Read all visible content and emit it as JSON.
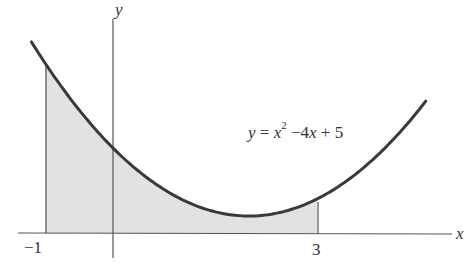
{
  "chart_data": {
    "type": "area",
    "title": "",
    "function": "y = x^2 - 4x + 5",
    "xlabel": "x",
    "ylabel": "y",
    "x_ticks": [
      "-1",
      "3"
    ],
    "shaded_interval": [
      -1,
      3
    ],
    "curve_domain": [
      -1.2,
      4.6
    ],
    "grid": false,
    "points": [
      {
        "x": -1,
        "y": 10
      },
      {
        "x": 0,
        "y": 5
      },
      {
        "x": 1,
        "y": 2
      },
      {
        "x": 2,
        "y": 1
      },
      {
        "x": 3,
        "y": 2
      },
      {
        "x": 4,
        "y": 5
      }
    ],
    "annotation": "y = x² −4x + 5"
  },
  "labels": {
    "x_axis": "x",
    "y_axis": "y",
    "tick_left": "−1",
    "tick_right": "3",
    "eq_y": "y",
    "eq_eq": " = ",
    "eq_x": "x",
    "eq_exp": "2",
    "eq_rest_a": " −4",
    "eq_rest_x": "x",
    "eq_rest_b": " + 5"
  },
  "colors": {
    "curve": "#3a3a3a",
    "fill": "#e3e3e3",
    "axis": "#555555"
  }
}
